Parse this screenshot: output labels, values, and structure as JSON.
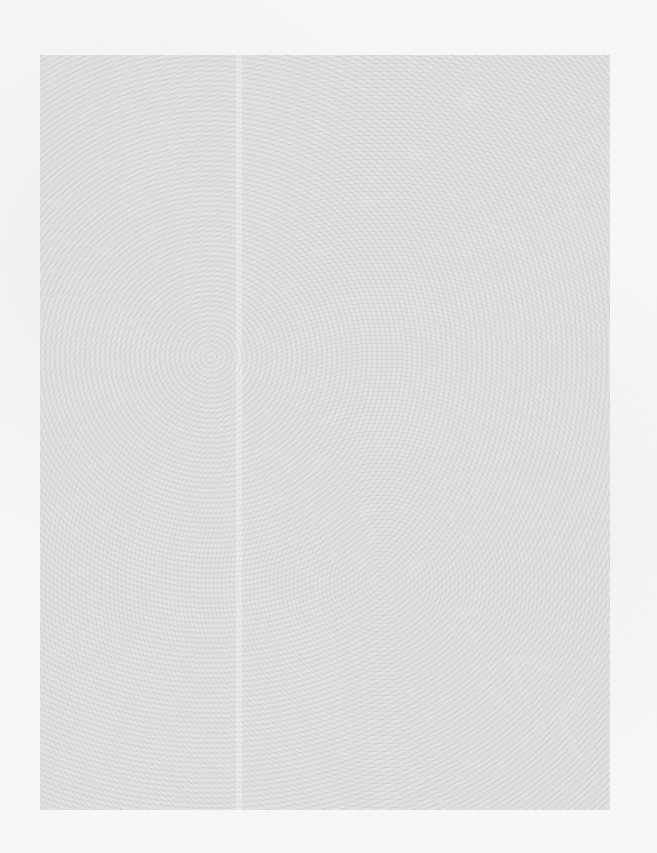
{
  "page": {
    "description": "",
    "background_color": "#f6f6f6",
    "scan_area_color": "#e2e2e2"
  }
}
